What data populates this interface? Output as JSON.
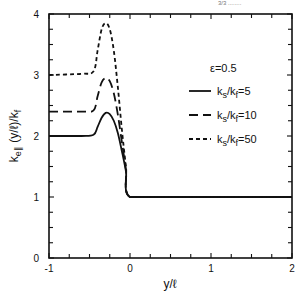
{
  "header": {
    "fragment": "3/3 ........"
  },
  "chart_data": {
    "type": "line",
    "title": "",
    "xlabel": "y/ℓ",
    "ylabel": "k_e∥ (y/ℓ) / k_f",
    "xlim": [
      -1,
      2
    ],
    "ylim": [
      0,
      4
    ],
    "x_ticks": [
      -1,
      0,
      1,
      2
    ],
    "y_ticks": [
      0,
      1,
      2,
      3,
      4
    ],
    "grid": false,
    "legend_position": "upper right",
    "annotation": "ε=0.5",
    "series": [
      {
        "name": "ks/kf=5",
        "label_main": "k",
        "label_sub1": "s",
        "label_mid": "/k",
        "label_sub2": "f",
        "label_end": "=5",
        "style": "solid",
        "x": [
          -1.0,
          -0.6,
          -0.45,
          -0.4,
          -0.35,
          -0.3,
          -0.25,
          -0.2,
          -0.15,
          -0.1,
          -0.05,
          0.0,
          0.5,
          1.0,
          1.5,
          2.0
        ],
        "y": [
          2.0,
          2.0,
          2.02,
          2.15,
          2.3,
          2.38,
          2.36,
          2.25,
          2.05,
          1.75,
          1.42,
          1.0,
          1.0,
          1.0,
          1.0,
          1.0
        ]
      },
      {
        "name": "ks/kf=10",
        "label_main": "k",
        "label_sub1": "s",
        "label_mid": "/k",
        "label_sub2": "f",
        "label_end": "=10",
        "style": "long-dash",
        "x": [
          -1.0,
          -0.6,
          -0.45,
          -0.4,
          -0.35,
          -0.3,
          -0.25,
          -0.2,
          -0.15,
          -0.1,
          -0.05,
          0.0,
          0.5,
          1.0,
          1.5,
          2.0
        ],
        "y": [
          2.4,
          2.4,
          2.42,
          2.65,
          2.88,
          2.95,
          2.9,
          2.7,
          2.35,
          1.9,
          1.45,
          1.0,
          1.0,
          1.0,
          1.0,
          1.0
        ]
      },
      {
        "name": "ks/kf=50",
        "label_main": "k",
        "label_sub1": "s",
        "label_mid": "/k",
        "label_sub2": "f",
        "label_end": "=50",
        "style": "short-dash",
        "x": [
          -1.0,
          -0.6,
          -0.45,
          -0.4,
          -0.35,
          -0.3,
          -0.25,
          -0.2,
          -0.15,
          -0.1,
          -0.05,
          0.0,
          0.5,
          1.0,
          1.5,
          2.0
        ],
        "y": [
          3.0,
          3.02,
          3.06,
          3.4,
          3.75,
          3.85,
          3.75,
          3.4,
          2.8,
          2.1,
          1.5,
          1.0,
          1.0,
          1.0,
          1.0,
          1.0
        ]
      }
    ]
  }
}
